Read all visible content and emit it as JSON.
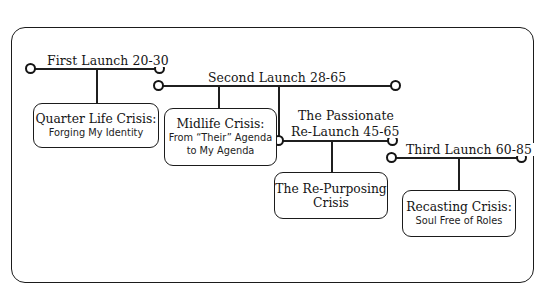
{
  "diagram": {
    "frame_color": "#1b1b1b",
    "line_color": "#1f1f1f",
    "background": "#ffffff",
    "stages": [
      {
        "id": "first-launch",
        "label": "First Launch 20-30",
        "age_range": "20-30"
      },
      {
        "id": "second-launch",
        "label": "Second Launch 28-65",
        "age_range": "28-65"
      },
      {
        "id": "passionate-relaunch",
        "label_line1": "The Passionate",
        "label_line2": "Re-Launch 45-65",
        "age_range": "45-65"
      },
      {
        "id": "third-launch",
        "label": "Third Launch 60-85",
        "age_range": "60-85"
      }
    ],
    "crises": [
      {
        "id": "quarter-life-crisis",
        "title": "Quarter Life Crisis:",
        "subtitle_lines": [
          "Forging My Identity"
        ]
      },
      {
        "id": "midlife-crisis",
        "title": "Midlife Crisis:",
        "subtitle_lines": [
          "From “Their” Agenda",
          "to My Agenda"
        ]
      },
      {
        "id": "re-purposing-crisis",
        "title": "The Re-Purposing",
        "subtitle_lines": [
          "Crisis"
        ]
      },
      {
        "id": "recasting-crisis",
        "title": "Recasting Crisis:",
        "subtitle_lines": [
          "Soul Free of Roles"
        ]
      }
    ]
  }
}
